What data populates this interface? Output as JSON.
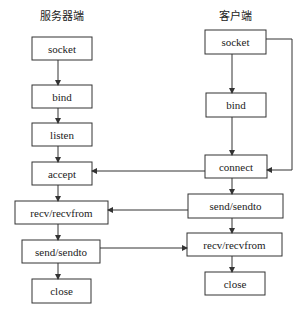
{
  "server": {
    "title": "服务器端",
    "steps": [
      "socket",
      "bind",
      "listen",
      "accept",
      "recv/recvfrom",
      "send/sendto",
      "close"
    ]
  },
  "client": {
    "title": "客户端",
    "steps": [
      "socket",
      "bind",
      "connect",
      "send/sendto",
      "recv/recvfrom",
      "close"
    ]
  },
  "connections": [
    {
      "from": "client.connect",
      "to": "server.accept"
    },
    {
      "from": "client.send/sendto",
      "to": "server.recv/recvfrom"
    },
    {
      "from": "server.send/sendto",
      "to": "client.recv/recvfrom"
    },
    {
      "from": "client.socket",
      "to": "client.connect",
      "note": "bypass bind"
    }
  ]
}
